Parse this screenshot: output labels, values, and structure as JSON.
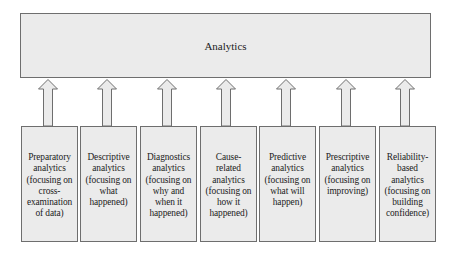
{
  "diagram": {
    "top": {
      "label": "Analytics"
    },
    "categories": [
      {
        "label": "Preparatory\nanalytics\n(focusing on\ncross-\nexamination\nof data)"
      },
      {
        "label": "Descriptive\nanalytics\n(focusing on\nwhat\nhappened)"
      },
      {
        "label": "Diagnostics\nanalytics\n(focusing on\nwhy and\nwhen it\nhappened)"
      },
      {
        "label": "Cause-\nrelated\nanalytics\n(focusing on\nhow it\nhappened)"
      },
      {
        "label": "Predictive\nanalytics\n(focusing on\nwhat will\nhappen)"
      },
      {
        "label": "Prescriptive\nanalytics\n(focusing on\nimproving)"
      },
      {
        "label": "Reliability-\nbased\nanalytics\n(focusing on\nbuilding\nconfidence)"
      }
    ],
    "arrow_icon": "up-arrow-icon",
    "colors": {
      "fill": "#ebebeb",
      "border": "#6e6e6e",
      "text": "#222222"
    }
  }
}
